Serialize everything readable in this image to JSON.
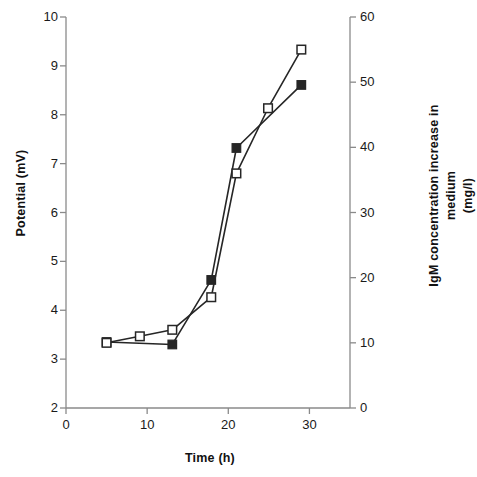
{
  "chart_data": {
    "type": "line",
    "title": "",
    "xlabel": "Time (h)",
    "ylabel": "Potential (mV)",
    "y2label_line1": "IgM concentration increase in medium",
    "y2label_line2": "(mg/l)",
    "xlim": [
      0,
      35
    ],
    "ylim": [
      2,
      10
    ],
    "y2lim": [
      0,
      60
    ],
    "xticks": [
      0,
      10,
      20,
      30
    ],
    "xtick_labels": [
      "0",
      "10",
      "20",
      "30"
    ],
    "yticks": [
      2,
      3,
      4,
      5,
      6,
      7,
      8,
      9,
      10
    ],
    "ytick_labels": [
      "2",
      "3",
      "4",
      "5",
      "6",
      "7",
      "8",
      "9",
      "10"
    ],
    "y2ticks": [
      0,
      10,
      20,
      30,
      40,
      50,
      60
    ],
    "y2tick_labels": [
      "0",
      "10",
      "20",
      "30",
      "40",
      "50",
      "60"
    ],
    "grid": false,
    "legend": "none",
    "series": [
      {
        "name": "Potential",
        "axis": "left",
        "marker": "filled-square",
        "color": "#262626",
        "points": [
          {
            "x": 5.0,
            "y": 3.35
          },
          {
            "x": 13.1,
            "y": 3.3
          },
          {
            "x": 17.9,
            "y": 4.62
          },
          {
            "x": 21.0,
            "y": 7.32
          },
          {
            "x": 29.0,
            "y": 8.61
          }
        ]
      },
      {
        "name": "IgM concentration increase in medium",
        "axis": "right",
        "marker": "open-square",
        "color": "#262626",
        "points": [
          {
            "x": 5.0,
            "y": 10.0
          },
          {
            "x": 9.1,
            "y": 11.0
          },
          {
            "x": 13.1,
            "y": 12.0
          },
          {
            "x": 17.9,
            "y": 17.0
          },
          {
            "x": 21.0,
            "y": 36.0
          },
          {
            "x": 24.9,
            "y": 46.0
          },
          {
            "x": 29.0,
            "y": 55.0
          }
        ]
      }
    ]
  }
}
